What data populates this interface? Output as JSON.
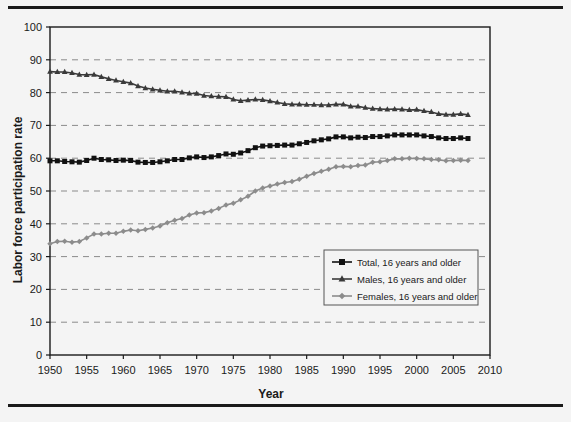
{
  "figure": {
    "axis_titles": {
      "x": "Year",
      "y": "Labor force participation rate"
    }
  },
  "chart_data": {
    "type": "line",
    "title": "",
    "xlabel": "Year",
    "ylabel": "Labor force participation rate",
    "xlim": [
      1950,
      2010
    ],
    "ylim": [
      0,
      100
    ],
    "xticks": [
      1950,
      1955,
      1960,
      1965,
      1970,
      1975,
      1980,
      1985,
      1990,
      1995,
      2000,
      2005,
      2010
    ],
    "yticks": [
      0,
      10,
      20,
      30,
      40,
      50,
      60,
      70,
      80,
      90,
      100
    ],
    "grid": "horizontal-dashed",
    "legend_position": "inside-lower-right",
    "x": [
      1950,
      1951,
      1952,
      1953,
      1954,
      1955,
      1956,
      1957,
      1958,
      1959,
      1960,
      1961,
      1962,
      1963,
      1964,
      1965,
      1966,
      1967,
      1968,
      1969,
      1970,
      1971,
      1972,
      1973,
      1974,
      1975,
      1976,
      1977,
      1978,
      1979,
      1980,
      1981,
      1982,
      1983,
      1984,
      1985,
      1986,
      1987,
      1988,
      1989,
      1990,
      1991,
      1992,
      1993,
      1994,
      1995,
      1996,
      1997,
      1998,
      1999,
      2000,
      2001,
      2002,
      2003,
      2004,
      2005,
      2006,
      2007
    ],
    "series": [
      {
        "name": "Total, 16 years and older",
        "marker": "square",
        "color": "#111111",
        "values": [
          59.2,
          59.2,
          59.0,
          58.9,
          58.8,
          59.3,
          60.0,
          59.6,
          59.5,
          59.3,
          59.4,
          59.3,
          58.8,
          58.7,
          58.7,
          58.9,
          59.2,
          59.6,
          59.6,
          60.1,
          60.4,
          60.2,
          60.4,
          60.8,
          61.3,
          61.2,
          61.6,
          62.3,
          63.2,
          63.7,
          63.8,
          63.9,
          64.0,
          64.0,
          64.4,
          64.8,
          65.3,
          65.6,
          65.9,
          66.5,
          66.5,
          66.2,
          66.4,
          66.3,
          66.6,
          66.6,
          66.8,
          67.1,
          67.1,
          67.1,
          67.1,
          66.8,
          66.6,
          66.2,
          66.0,
          66.0,
          66.2,
          66.0
        ]
      },
      {
        "name": "Males, 16 years and older",
        "marker": "triangle",
        "color": "#3a3a3a",
        "values": [
          86.4,
          86.3,
          86.3,
          86.0,
          85.5,
          85.4,
          85.5,
          84.8,
          84.2,
          83.7,
          83.3,
          82.9,
          82.0,
          81.4,
          81.0,
          80.7,
          80.4,
          80.4,
          80.1,
          79.8,
          79.7,
          79.1,
          78.9,
          78.8,
          78.7,
          77.9,
          77.5,
          77.7,
          77.9,
          77.8,
          77.4,
          77.0,
          76.6,
          76.4,
          76.4,
          76.3,
          76.3,
          76.2,
          76.2,
          76.4,
          76.4,
          75.8,
          75.8,
          75.4,
          75.1,
          75.0,
          74.9,
          75.0,
          74.9,
          74.7,
          74.8,
          74.4,
          74.1,
          73.5,
          73.3,
          73.3,
          73.5,
          73.2
        ]
      },
      {
        "name": "Females, 16 years and older",
        "marker": "diamond",
        "color": "#8c8c8c",
        "values": [
          33.9,
          34.6,
          34.7,
          34.4,
          34.6,
          35.7,
          36.9,
          36.9,
          37.1,
          37.1,
          37.7,
          38.1,
          37.9,
          38.3,
          38.7,
          39.3,
          40.3,
          41.1,
          41.6,
          42.7,
          43.3,
          43.4,
          43.9,
          44.7,
          45.7,
          46.3,
          47.3,
          48.4,
          50.0,
          50.9,
          51.5,
          52.1,
          52.6,
          52.9,
          53.6,
          54.5,
          55.3,
          56.0,
          56.6,
          57.4,
          57.5,
          57.4,
          57.8,
          57.9,
          58.8,
          58.9,
          59.3,
          59.8,
          59.8,
          60.0,
          59.9,
          59.8,
          59.6,
          59.5,
          59.2,
          59.3,
          59.4,
          59.3
        ]
      }
    ]
  }
}
